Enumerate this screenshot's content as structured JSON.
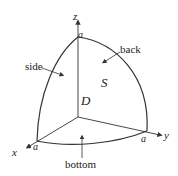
{
  "diagram": {
    "axes": {
      "x": "x",
      "y": "y",
      "z": "z"
    },
    "intercepts": {
      "top": "a",
      "x": "a",
      "y": "a"
    },
    "surface_labels": {
      "side": "side",
      "back": "back",
      "bottom": "bottom"
    },
    "surface_symbol": "S",
    "region_label": "D",
    "colors": {
      "line": "#333333",
      "text": "#222222",
      "background": "#ffffff"
    }
  }
}
